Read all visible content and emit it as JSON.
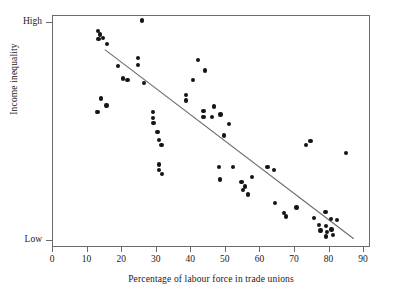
{
  "chart_data": {
    "type": "scatter",
    "title": "",
    "xlabel": "Percentage of labour force in trade unions",
    "ylabel": "Income inequality",
    "xlim": [
      0,
      92
    ],
    "ylim": [
      0,
      100
    ],
    "grid": false,
    "legend": null,
    "xticks": [
      0,
      10,
      20,
      30,
      40,
      50,
      60,
      70,
      80,
      90
    ],
    "xtick_labels": [
      "0",
      "10",
      "20",
      "30",
      "40",
      "50",
      "60",
      "70",
      "80",
      "90"
    ],
    "ytick_labels": [
      "High",
      "Low"
    ],
    "ytick_values": [
      97,
      3
    ],
    "marker_color": "#151515",
    "line_color": "#6b6b6b",
    "frame_color": "#6b6b6b",
    "series": [
      {
        "name": "Countries",
        "points": [
          {
            "x": 13.0,
            "y": 93.5
          },
          {
            "x": 13.6,
            "y": 92.0
          },
          {
            "x": 13.2,
            "y": 90.0
          },
          {
            "x": 14.4,
            "y": 90.5
          },
          {
            "x": 15.6,
            "y": 88.0
          },
          {
            "x": 25.8,
            "y": 98.0
          },
          {
            "x": 18.8,
            "y": 78.5
          },
          {
            "x": 20.3,
            "y": 73.0
          },
          {
            "x": 21.5,
            "y": 72.5
          },
          {
            "x": 24.6,
            "y": 82.0
          },
          {
            "x": 24.6,
            "y": 79.0
          },
          {
            "x": 26.4,
            "y": 71.0
          },
          {
            "x": 13.8,
            "y": 64.5
          },
          {
            "x": 15.5,
            "y": 61.5
          },
          {
            "x": 12.9,
            "y": 58.5
          },
          {
            "x": 29.0,
            "y": 58.5
          },
          {
            "x": 29.0,
            "y": 56.0
          },
          {
            "x": 29.1,
            "y": 54.0
          },
          {
            "x": 30.2,
            "y": 50.0
          },
          {
            "x": 30.6,
            "y": 46.5
          },
          {
            "x": 31.4,
            "y": 44.5
          },
          {
            "x": 30.6,
            "y": 36.0
          },
          {
            "x": 30.7,
            "y": 33.5
          },
          {
            "x": 31.5,
            "y": 32.0
          },
          {
            "x": 38.4,
            "y": 66.0
          },
          {
            "x": 38.5,
            "y": 63.5
          },
          {
            "x": 40.5,
            "y": 72.5
          },
          {
            "x": 42.0,
            "y": 81.0
          },
          {
            "x": 43.5,
            "y": 59.0
          },
          {
            "x": 44.0,
            "y": 76.5
          },
          {
            "x": 43.5,
            "y": 56.5
          },
          {
            "x": 46.0,
            "y": 56.5
          },
          {
            "x": 46.5,
            "y": 61.0
          },
          {
            "x": 48.5,
            "y": 57.5
          },
          {
            "x": 51.0,
            "y": 53.5
          },
          {
            "x": 49.5,
            "y": 48.5
          },
          {
            "x": 48.0,
            "y": 35.0
          },
          {
            "x": 48.3,
            "y": 29.5
          },
          {
            "x": 52.0,
            "y": 35.0
          },
          {
            "x": 54.5,
            "y": 28.5
          },
          {
            "x": 55.0,
            "y": 25.0
          },
          {
            "x": 56.5,
            "y": 23.0
          },
          {
            "x": 55.5,
            "y": 26.5
          },
          {
            "x": 57.5,
            "y": 30.5
          },
          {
            "x": 62.0,
            "y": 35.0
          },
          {
            "x": 64.0,
            "y": 33.5
          },
          {
            "x": 64.3,
            "y": 19.5
          },
          {
            "x": 66.8,
            "y": 15.0
          },
          {
            "x": 67.4,
            "y": 13.5
          },
          {
            "x": 70.5,
            "y": 17.5
          },
          {
            "x": 73.2,
            "y": 44.5
          },
          {
            "x": 74.5,
            "y": 46.0
          },
          {
            "x": 75.5,
            "y": 13.0
          },
          {
            "x": 77.0,
            "y": 10.0
          },
          {
            "x": 77.4,
            "y": 7.5
          },
          {
            "x": 78.8,
            "y": 15.5
          },
          {
            "x": 79.0,
            "y": 9.5
          },
          {
            "x": 79.3,
            "y": 7.0
          },
          {
            "x": 78.9,
            "y": 5.0
          },
          {
            "x": 80.4,
            "y": 12.5
          },
          {
            "x": 80.6,
            "y": 8.0
          },
          {
            "x": 81.0,
            "y": 5.5
          },
          {
            "x": 82.2,
            "y": 12.0
          },
          {
            "x": 84.8,
            "y": 41.0
          }
        ]
      }
    ],
    "trendline": {
      "type": "linear",
      "x_start": 15.0,
      "y_start": 85.5,
      "x_end": 87.0,
      "y_end": 4.0
    }
  }
}
